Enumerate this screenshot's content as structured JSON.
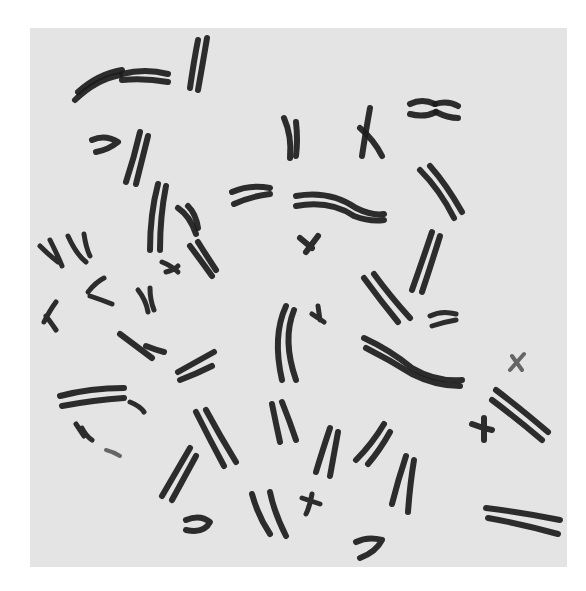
{
  "image": {
    "description": "Metaphase chromosome spread, black-stained chromosomes on light grey background",
    "background_color": "#ffffff",
    "panel_color": "#e4e4e4",
    "chromosome_color": "#1c1c1c"
  }
}
